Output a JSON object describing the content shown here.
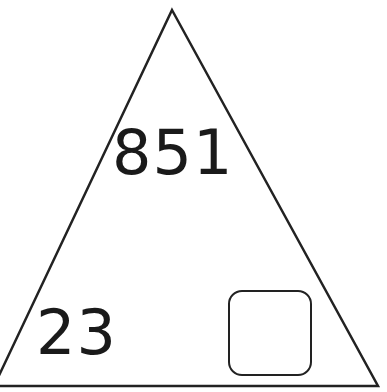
{
  "diagram": {
    "shape": "triangle",
    "top_value": "851",
    "bottom_left_value": "23",
    "bottom_right_value": "",
    "answer_box": "empty",
    "colors": {
      "stroke": "#222222",
      "text": "#1a1a1a",
      "background": "#ffffff"
    }
  }
}
